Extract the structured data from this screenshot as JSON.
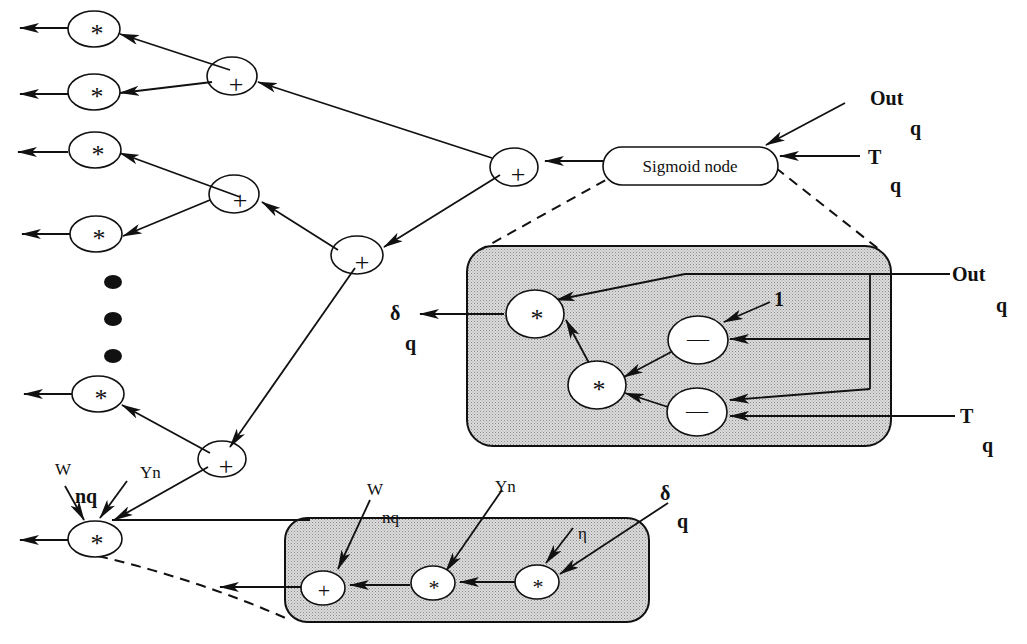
{
  "diagram": {
    "type": "computation-graph",
    "top_right_inputs": {
      "out_label": "Out",
      "out_sub": "q",
      "t_label": "T",
      "t_sub": "q"
    },
    "sigmoid_node": {
      "label": "Sigmoid node"
    },
    "left_multiply_nodes": [
      {
        "op": "*"
      },
      {
        "op": "*"
      },
      {
        "op": "*"
      },
      {
        "op": "*"
      },
      {
        "op": "*"
      },
      {
        "op": "*"
      }
    ],
    "sum_nodes": [
      {
        "op": "+"
      },
      {
        "op": "+"
      },
      {
        "op": "+"
      },
      {
        "op": "+"
      },
      {
        "op": "+"
      }
    ],
    "ellipsis": "• • •",
    "sigmoid_expansion": {
      "delta_label": "δ",
      "delta_sub": "q",
      "one_label": "1",
      "out_label": "Out",
      "out_sub": "q",
      "t_label": "T",
      "t_sub": "q",
      "nodes": [
        {
          "id": "mul-out",
          "op": "*"
        },
        {
          "id": "mul-inner",
          "op": "*"
        },
        {
          "id": "minus-top",
          "op": "—"
        },
        {
          "id": "minus-bottom",
          "op": "—"
        }
      ]
    },
    "weight_node": {
      "w_label": "W",
      "w_sub": "nq",
      "y_label": "Yn",
      "op": "*"
    },
    "weight_update_expansion": {
      "w_label": "W",
      "w_sub": "nq",
      "y_label": "Yn",
      "eta_label": "η",
      "delta_label": "δ",
      "delta_sub": "q",
      "nodes": [
        {
          "id": "plus",
          "op": "+"
        },
        {
          "id": "mul-y",
          "op": "*"
        },
        {
          "id": "mul-eta",
          "op": "*"
        }
      ]
    }
  }
}
